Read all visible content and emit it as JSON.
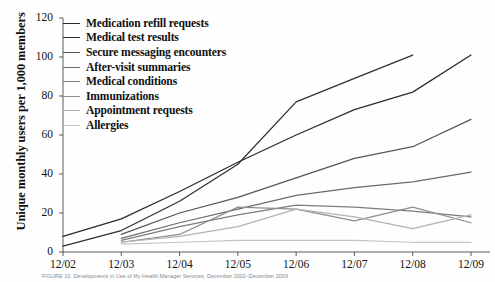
{
  "chart_data": {
    "type": "line",
    "title": "",
    "xlabel": "",
    "ylabel": "Unique monthly users per 1,000 members",
    "x": [
      "12/02",
      "12/03",
      "12/04",
      "12/05",
      "12/06",
      "12/07",
      "12/08",
      "12/09"
    ],
    "ylim": [
      0,
      120
    ],
    "yticks": [
      0,
      20,
      40,
      60,
      80,
      100,
      120
    ],
    "grid": false,
    "legend_position": "top-left",
    "series": [
      {
        "name": "Medication refill requests",
        "color": "#2b2b2b",
        "values": [
          8,
          17,
          31,
          46,
          60,
          73,
          82,
          101
        ]
      },
      {
        "name": "Medical test results",
        "color": "#303030",
        "values": [
          3,
          11,
          26,
          45,
          77,
          89,
          101,
          null
        ]
      },
      {
        "name": "Secure messaging encounters",
        "color": "#555555",
        "values": [
          null,
          9,
          20,
          28,
          38,
          48,
          54,
          68
        ]
      },
      {
        "name": "After-visit summaries",
        "color": "#6b6b6b",
        "values": [
          null,
          7,
          15,
          22,
          29,
          33,
          36,
          41
        ]
      },
      {
        "name": "Medical conditions",
        "color": "#7d7d7d",
        "values": [
          null,
          6,
          13,
          19,
          24,
          23,
          21,
          18
        ]
      },
      {
        "name": "Immunizations",
        "color": "#8e8e8e",
        "values": [
          null,
          5,
          9,
          23,
          22,
          16,
          23,
          15
        ]
      },
      {
        "name": "Appointment requests",
        "color": "#b2b2b2",
        "values": [
          null,
          5,
          8,
          13,
          22,
          18,
          12,
          19
        ]
      },
      {
        "name": "Allergies",
        "color": "#c4c4c4",
        "values": [
          null,
          4,
          5,
          6,
          6,
          6,
          5,
          5
        ]
      }
    ]
  },
  "caption": {
    "text": "FIGURE 10. Developments in Use of My Health Manager Services, December 2002–December 2009"
  }
}
